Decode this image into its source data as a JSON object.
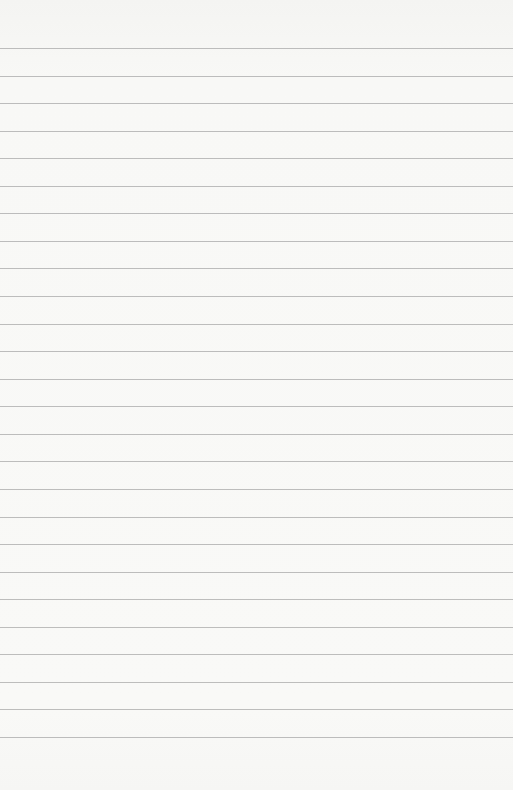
{
  "paper": {
    "type": "lined-sheet",
    "line_count": 26,
    "first_line_y": 48,
    "line_spacing": 27.56,
    "line_color": "#a8a8a8",
    "background_color": "#f8f8f6"
  }
}
